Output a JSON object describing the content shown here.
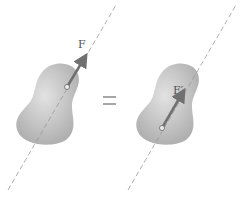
{
  "diagram": {
    "left": {
      "force_label": "F"
    },
    "equals": "=",
    "right": {
      "force_label": "F′"
    }
  },
  "colors": {
    "body": "#b8b8b8",
    "line": "#9a9a9a",
    "arrow": "#707070"
  }
}
